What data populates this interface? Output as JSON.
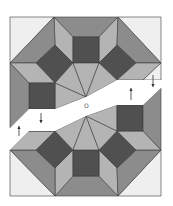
{
  "figure": {
    "center_label": "O",
    "colors": {
      "white": "#efefef",
      "light": "#b4b4b4",
      "medium": "#8c8c8c",
      "dark": "#505050",
      "stroke": "#3a3a3a",
      "arrow": "#333333"
    },
    "pieces": [
      {
        "name": "top-left-corner-triangle",
        "fill": "white",
        "points": "10,17 54,17 10,63"
      },
      {
        "name": "top-right-corner-triangle",
        "fill": "white",
        "points": "118,17 161,17 161,63"
      },
      {
        "name": "top-trapezoid",
        "fill": "medium",
        "points": "54,17 118,17 99,37 73,37"
      },
      {
        "name": "top-left-kite",
        "fill": "light",
        "points": "54,17 73,37 73,63 55,45"
      },
      {
        "name": "top-right-kite",
        "fill": "light",
        "points": "118,17 99,37 99,63 117,45"
      },
      {
        "name": "top-center-square",
        "fill": "dark",
        "points": "73,37 99,37 99,63 73,63"
      },
      {
        "name": "top-left-trapezoid",
        "fill": "medium",
        "points": "10,63 54,17 55,45 36,63"
      },
      {
        "name": "top-right-trapezoid",
        "fill": "medium",
        "points": "161,63 118,17 117,45 136,63"
      },
      {
        "name": "top-left-diamond",
        "fill": "dark",
        "points": "55,45 73,63 55,83 36,63"
      },
      {
        "name": "top-right-diamond",
        "fill": "dark",
        "points": "117,45 136,63 117,80 99,63"
      },
      {
        "name": "left-rhombus",
        "fill": "light",
        "points": "10,63 36,63 55,83 29,83"
      },
      {
        "name": "right-rhombus",
        "fill": "light",
        "points": "161,63 136,63 117,80 143,80"
      },
      {
        "name": "fan-left",
        "fill": "light",
        "points": "55,83 73,63 86,97"
      },
      {
        "name": "fan-center",
        "fill": "light",
        "points": "73,63 99,63 86,97"
      },
      {
        "name": "fan-right",
        "fill": "light",
        "points": "99,63 117,80 86,97"
      },
      {
        "name": "fan-left-lower",
        "fill": "light",
        "points": "55,83 86,97 55,109"
      },
      {
        "name": "left-square",
        "fill": "dark",
        "points": "29,83 55,83 55,109 29,109"
      },
      {
        "name": "left-strip",
        "fill": "medium",
        "points": "10,63 29,83 29,109 10,128"
      },
      {
        "name": "right-strip-top",
        "fill": "white",
        "points": "143,80 161,63 161,80"
      },
      {
        "name": "bottom-left-corner-triangle",
        "fill": "white",
        "points": "10,150 55,196 10,196"
      },
      {
        "name": "bottom-right-corner-triangle",
        "fill": "white",
        "points": "161,150 161,196 118,196"
      },
      {
        "name": "bottom-trapezoid",
        "fill": "medium",
        "points": "73,176 99,176 118,196 55,196"
      },
      {
        "name": "bottom-left-kite",
        "fill": "light",
        "points": "55,168 73,150 73,176 55,196"
      },
      {
        "name": "bottom-right-kite",
        "fill": "light",
        "points": "117,168 99,150 99,176 118,196"
      },
      {
        "name": "bottom-center-square",
        "fill": "dark",
        "points": "73,150 99,150 99,176 73,176"
      },
      {
        "name": "bottom-left-trapezoid",
        "fill": "medium",
        "points": "10,150 36,150 55,168 55,196"
      },
      {
        "name": "bottom-right-trapezoid",
        "fill": "medium",
        "points": "161,150 136,150 117,168 118,196"
      },
      {
        "name": "bottom-left-diamond",
        "fill": "dark",
        "points": "55,131 73,150 55,168 36,150"
      },
      {
        "name": "bottom-right-diamond",
        "fill": "dark",
        "points": "117,131 136,150 117,168 99,150"
      },
      {
        "name": "bottom-left-rhombus",
        "fill": "light",
        "points": "29,131 55,131 36,150 10,150"
      },
      {
        "name": "bottom-right-rhombus",
        "fill": "light",
        "points": "117,131 143,131 161,150 136,150"
      },
      {
        "name": "bottom-fan-left",
        "fill": "light",
        "points": "55,131 86,116 73,150"
      },
      {
        "name": "bottom-fan-center",
        "fill": "light",
        "points": "73,150 86,116 99,150"
      },
      {
        "name": "bottom-fan-right",
        "fill": "light",
        "points": "99,150 86,116 117,131"
      },
      {
        "name": "bottom-fan-right-upper",
        "fill": "light",
        "points": "86,116 117,105 117,131"
      },
      {
        "name": "right-square",
        "fill": "dark",
        "points": "117,105 143,105 143,131 117,131"
      },
      {
        "name": "right-strip",
        "fill": "medium",
        "points": "143,105 161,88 161,150 143,131"
      },
      {
        "name": "left-lower-gap-piece",
        "fill": "light",
        "points": "29,131 55,131 55,131"
      }
    ],
    "gaps": [
      {
        "name": "upper-gap",
        "points": "10,128 29,109 55,109 86,97 117,80 143,80 161,80 161,88 143,105 117,105 86,116 55,131 29,131 10,150"
      }
    ],
    "arrows": [
      {
        "name": "left-down-arrow",
        "x": 41,
        "y1": 113,
        "y2": 123,
        "direction": "down"
      },
      {
        "name": "left-up-arrow",
        "x": 19,
        "y1": 136,
        "y2": 126,
        "direction": "up"
      },
      {
        "name": "right-down-arrow",
        "x": 153,
        "y1": 75,
        "y2": 87,
        "direction": "down"
      },
      {
        "name": "right-up-arrow",
        "x": 131,
        "y1": 100,
        "y2": 88,
        "direction": "up"
      }
    ],
    "center_point": {
      "x": 86,
      "y": 107
    }
  }
}
